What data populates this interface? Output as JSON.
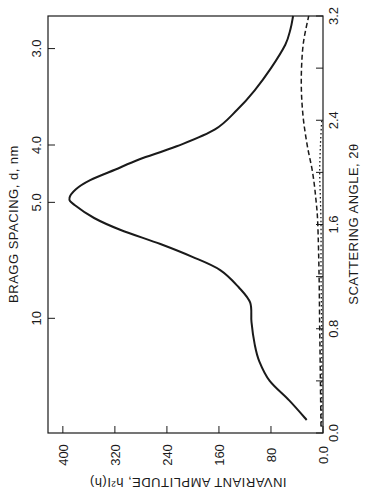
{
  "chart_data": {
    "type": "line",
    "orientation": "rotated 90 degrees (x-axis vertical on right, y-axis horizontal at bottom)",
    "title": "",
    "xlabel": "SCATTERING ANGLE, 2θ",
    "ylabel": "INVARIANT AMPLITUDE, h²I(h)",
    "secondary_xlabel": "BRAGG SPACING, d, nm",
    "xlim": [
      0.0,
      3.2
    ],
    "ylim": [
      0,
      400
    ],
    "x_ticks": [
      "0.0",
      "0.8",
      "1.6",
      "2.4",
      "3.2"
    ],
    "x_minor_ticks": [
      0.4,
      1.2,
      2.0,
      2.8
    ],
    "y_ticks": [
      "400",
      "320",
      "240",
      "160",
      "80",
      "0.0"
    ],
    "secondary_ticks": [
      {
        "label": "3.0",
        "angle": 2.95
      },
      {
        "label": "4.0",
        "angle": 2.21
      },
      {
        "label": "5.0",
        "angle": 1.77
      },
      {
        "label": "10",
        "angle": 0.88
      }
    ],
    "grid": false,
    "series": [
      {
        "name": "solid",
        "style": "solid",
        "x": [
          0.1,
          0.25,
          0.4,
          0.55,
          0.68,
          0.85,
          1.0,
          1.12,
          1.25,
          1.35,
          1.45,
          1.56,
          1.65,
          1.75,
          1.8,
          1.87,
          1.94,
          2.02,
          2.1,
          2.2,
          2.33,
          2.48,
          2.63,
          2.8,
          2.98,
          3.1,
          3.2
        ],
        "values": [
          25,
          52,
          82,
          98,
          105,
          110,
          112,
          130,
          158,
          200,
          250,
          312,
          352,
          382,
          390,
          380,
          358,
          320,
          282,
          225,
          166,
          132,
          105,
          80,
          58,
          50,
          46
        ]
      },
      {
        "name": "dashed",
        "style": "dashed",
        "x": [
          0.05,
          0.4,
          0.8,
          1.2,
          1.6,
          1.8,
          2.0,
          2.2,
          2.4,
          2.6,
          2.8,
          3.0,
          3.2
        ],
        "values": [
          3,
          4,
          5,
          6,
          8,
          11,
          16,
          24,
          30,
          33,
          33,
          30,
          22
        ]
      },
      {
        "name": "dotted",
        "style": "dotted",
        "x": [
          0.05,
          0.4,
          0.8,
          1.2,
          1.6,
          1.8,
          2.0,
          2.2,
          2.4
        ],
        "values": [
          2,
          2,
          2,
          3,
          3,
          4,
          5,
          4,
          2
        ]
      }
    ]
  }
}
